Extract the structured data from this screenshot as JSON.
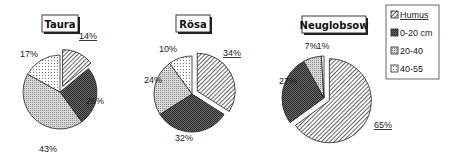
{
  "chart_data": {
    "type": "pie",
    "legend": {
      "position": "right",
      "entries": [
        "Humus",
        "0-20 cm",
        "20-40",
        "40-55"
      ]
    },
    "charts": [
      {
        "title": "Taura",
        "categories": [
          "Humus",
          "0-20 cm",
          "20-40",
          "40-55"
        ],
        "values": [
          14,
          26,
          43,
          17
        ],
        "labels": [
          "14%",
          "26%",
          "43%",
          "17%"
        ],
        "exploded": "Humus"
      },
      {
        "title": "Rösa",
        "categories": [
          "Humus",
          "0-20 cm",
          "20-40",
          "40-55"
        ],
        "values": [
          34,
          32,
          24,
          10
        ],
        "labels": [
          "34%",
          "32%",
          "24%",
          "10%"
        ],
        "exploded": "Humus"
      },
      {
        "title": "Neuglobsow",
        "categories": [
          "Humus",
          "0-20 cm",
          "20-40",
          "40-55"
        ],
        "values": [
          65,
          27,
          7,
          1
        ],
        "labels": [
          "65%",
          "27%",
          "7%",
          "1%"
        ],
        "exploded": "Humus"
      }
    ]
  },
  "patterns": {
    "Humus": "diagonal-hatch",
    "0-20 cm": "dark-crosshatch",
    "20-40": "light-dots",
    "40-55": "sparse-dots"
  }
}
